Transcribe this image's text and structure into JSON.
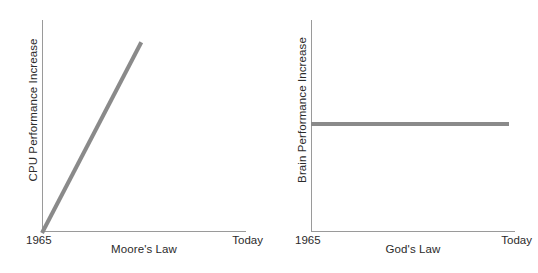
{
  "figure": {
    "background_color": "#ffffff",
    "axis_color": "#9a9a9a",
    "series_color": "#8a8a8a",
    "text_color": "#2b2b2b"
  },
  "chart_data": [
    {
      "type": "line",
      "title": "",
      "xlabel": "Moore's Law",
      "ylabel": "CPU Performance Increase",
      "xticklabels": [
        "1965",
        "Today"
      ],
      "yticklabels": [],
      "grid": false,
      "legend": "none",
      "xlim": [
        0,
        1
      ],
      "ylim": [
        0,
        1
      ],
      "series": [
        {
          "name": "CPU Performance Increase",
          "color": "#8a8a8a",
          "x": [
            0,
            1
          ],
          "values": [
            0,
            0.9
          ]
        }
      ],
      "annotations": []
    },
    {
      "type": "line",
      "title": "",
      "xlabel": "God's Law",
      "ylabel": "Brain Performance Increase",
      "xticklabels": [
        "1965",
        "Today"
      ],
      "yticklabels": [],
      "grid": false,
      "legend": "none",
      "xlim": [
        0,
        1
      ],
      "ylim": [
        0,
        1
      ],
      "series": [
        {
          "name": "Brain Performance Increase",
          "color": "#8a8a8a",
          "x": [
            0,
            1
          ],
          "values": [
            0.52,
            0.52
          ]
        }
      ],
      "annotations": []
    }
  ],
  "panels": {
    "left": {
      "ylabel": "CPU Performance Increase",
      "xlabel": "Moore's Law",
      "tick_start": "1965",
      "tick_end": "Today"
    },
    "right": {
      "ylabel": "Brain Performance Increase",
      "xlabel": "God's Law",
      "tick_start": "1965",
      "tick_end": "Today"
    }
  }
}
